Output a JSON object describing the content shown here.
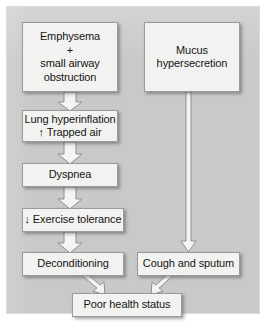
{
  "diagram": {
    "type": "flowchart",
    "title": "",
    "background_color": "#c9c9c9",
    "node_fill_color": "#f2f2f0",
    "node_border_color": "#9a9a9a",
    "text_color": "#141414",
    "nodes": [
      {
        "id": "emphysema",
        "label": "Emphysema\n+\nsmall airway\nobstruction"
      },
      {
        "id": "mucus",
        "label": "Mucus\nhypersecretion"
      },
      {
        "id": "hyperinflation",
        "label": "Lung hyperinflation\n↑ Trapped air"
      },
      {
        "id": "dyspnea",
        "label": "Dyspnea"
      },
      {
        "id": "exercise",
        "label": "↓ Exercise tolerance"
      },
      {
        "id": "deconditioning",
        "label": "Deconditioning"
      },
      {
        "id": "cough",
        "label": "Cough and sputum"
      },
      {
        "id": "poorhealth",
        "label": "Poor health status"
      }
    ],
    "edges": [
      {
        "from": "emphysema",
        "to": "hyperinflation",
        "style": "block-arrow-down"
      },
      {
        "from": "hyperinflation",
        "to": "dyspnea",
        "style": "block-arrow-down"
      },
      {
        "from": "dyspnea",
        "to": "exercise",
        "style": "block-arrow-down"
      },
      {
        "from": "exercise",
        "to": "deconditioning",
        "style": "block-arrow-down"
      },
      {
        "from": "mucus",
        "to": "cough",
        "style": "long-line-arrow-down"
      },
      {
        "from": "deconditioning",
        "to": "poorhealth",
        "style": "block-arrow-diagonal-right"
      },
      {
        "from": "cough",
        "to": "poorhealth",
        "style": "block-arrow-diagonal-left"
      }
    ]
  }
}
